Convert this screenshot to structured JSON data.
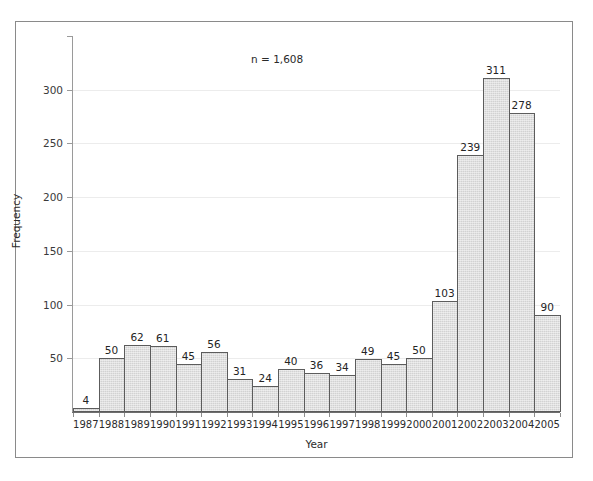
{
  "figure": {
    "annotation": "n = 1,608",
    "background_color": "#ffffff",
    "frame_color": "#8a8a8a",
    "bar_fill_color": "#d2d2d2",
    "bar_edge_color": "#5c5c5c",
    "gridline_color": "#ececec"
  },
  "chart_data": {
    "type": "bar",
    "title": "",
    "xlabel": "Year",
    "ylabel": "Frequency",
    "categories": [
      "1987",
      "1988",
      "1989",
      "1990",
      "1991",
      "1992",
      "1993",
      "1994",
      "1995",
      "1996",
      "1997",
      "1998",
      "1999",
      "2000",
      "2001",
      "2002",
      "2003",
      "2004",
      "2005"
    ],
    "values": [
      4,
      50,
      62,
      61,
      45,
      56,
      31,
      24,
      40,
      36,
      34,
      49,
      45,
      50,
      103,
      239,
      311,
      278,
      90
    ],
    "data_labels": [
      "4",
      "50",
      "62",
      "61",
      "45",
      "56",
      "31",
      "24",
      "40",
      "36",
      "34",
      "49",
      "45",
      "50",
      "103",
      "239",
      "311",
      "278",
      "90"
    ],
    "ylim": [
      0,
      350
    ],
    "yticks": [
      50,
      100,
      150,
      200,
      250,
      300
    ],
    "ytick_labels": [
      "50",
      "100",
      "150",
      "200",
      "250",
      "300"
    ],
    "grid": true,
    "legend": null,
    "annotations": [
      "n = 1,608"
    ],
    "total": 1608
  }
}
